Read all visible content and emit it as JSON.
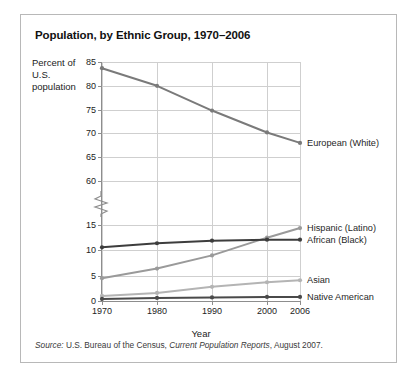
{
  "figure": {
    "title": "Population, by Ethnic Group, 1970–2006",
    "y_axis_title": "Percent of U.S. population",
    "x_axis_title": "Year",
    "source_prefix": "Source:",
    "source_body": " U.S. Bureau of the Census, ",
    "source_italic": "Current Population Reports",
    "source_suffix": ", August 2007."
  },
  "chart_data": {
    "type": "line",
    "title": "Population, by Ethnic Group, 1970–2006",
    "xlabel": "Year",
    "ylabel": "Percent of U.S. population",
    "x": [
      1970,
      1980,
      1990,
      2000,
      2006
    ],
    "xticklabels": [
      "1970",
      "1980",
      "1990",
      "2000",
      "2006"
    ],
    "yticklabels": [
      "0",
      "5",
      "10",
      "15",
      "60",
      "65",
      "70",
      "75",
      "80",
      "85"
    ],
    "ylim_lower": [
      0,
      15
    ],
    "ylim_upper": [
      60,
      85
    ],
    "axis_break": true,
    "axis_break_between": [
      15,
      60
    ],
    "grid": true,
    "legend_position": "right-of-plot-inline",
    "series": [
      {
        "name": "European (White)",
        "color": "#7a7a7a",
        "values": [
          83.7,
          80.0,
          74.8,
          70.2,
          68.0
        ]
      },
      {
        "name": "Hispanic (Latino)",
        "color": "#9a9a9a",
        "values": [
          4.5,
          6.4,
          9.0,
          12.5,
          14.4
        ]
      },
      {
        "name": "African (Black)",
        "color": "#3d3d3d",
        "values": [
          10.6,
          11.4,
          11.9,
          12.1,
          12.1
        ]
      },
      {
        "name": "Asian",
        "color": "#b4b4b4",
        "values": [
          1.0,
          1.6,
          2.8,
          3.7,
          4.1
        ]
      },
      {
        "name": "Native American",
        "color": "#4a4a4a",
        "values": [
          0.4,
          0.6,
          0.7,
          0.8,
          0.8
        ]
      }
    ]
  }
}
